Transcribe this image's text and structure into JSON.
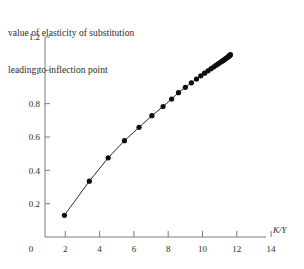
{
  "chart_data": {
    "type": "line",
    "title": "value of elasticity of substitution leading to inflection point",
    "title_lines": [
      "value of elasticity of substitution",
      "leading to inflection point"
    ],
    "xlabel": "K/Y",
    "ylabel": "",
    "xlim": [
      0,
      14.6
    ],
    "ylim": [
      0,
      1.2
    ],
    "xticks": [
      0,
      2,
      4,
      6,
      8,
      10,
      12,
      14
    ],
    "xtick_labels": [
      "0",
      "2",
      "4",
      "6",
      "8",
      "10",
      "12",
      "14"
    ],
    "yticks": [
      0.2,
      0.4,
      0.6,
      0.8,
      1,
      1.2
    ],
    "ytick_labels": [
      "0.2",
      "0.4",
      "0.6",
      "0.8",
      "1",
      "1.2"
    ],
    "grid": false,
    "legend": false,
    "marker": "filled-circle",
    "marker_color": "#0d0d0d",
    "line_color": "#2a2a2a",
    "x": [
      1.95,
      3.4,
      4.5,
      5.45,
      6.3,
      7.05,
      7.7,
      8.2,
      8.6,
      9.0,
      9.35,
      9.65,
      9.9,
      10.12,
      10.32,
      10.5,
      10.66,
      10.8,
      10.93,
      11.04,
      11.14,
      11.23,
      11.31,
      11.38,
      11.44,
      11.49,
      11.53,
      11.57,
      11.6,
      11.63
    ],
    "y": [
      0.13,
      0.335,
      0.475,
      0.578,
      0.658,
      0.728,
      0.783,
      0.828,
      0.866,
      0.898,
      0.925,
      0.948,
      0.967,
      0.983,
      0.997,
      1.01,
      1.021,
      1.031,
      1.04,
      1.048,
      1.055,
      1.061,
      1.067,
      1.072,
      1.077,
      1.081,
      1.085,
      1.088,
      1.091,
      1.094
    ]
  },
  "axes": {
    "x_axis_name": "K/Y",
    "y_axis_name": "value of elasticity of substitution"
  }
}
